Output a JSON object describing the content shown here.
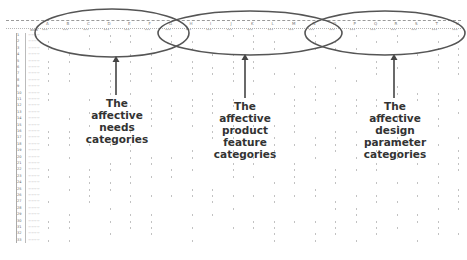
{
  "figure": {
    "spreadsheet": {
      "column_letters": [
        "A",
        "B",
        "C",
        "D",
        "E",
        "F",
        "G",
        "H",
        "I",
        "J",
        "K",
        "L",
        "M",
        "N",
        "O",
        "P",
        "Q",
        "R",
        "S",
        "T",
        "U"
      ],
      "row_count": 33,
      "first_column_header": "word"
    },
    "annotations": [
      {
        "id": "needs",
        "label_lines": [
          "The",
          "affective",
          "needs",
          "categories"
        ]
      },
      {
        "id": "product_feature",
        "label_lines": [
          "The",
          "affective",
          "product",
          "feature",
          "categories"
        ]
      },
      {
        "id": "design_parameter",
        "label_lines": [
          "The",
          "affective",
          "design",
          "parameter",
          "categories"
        ]
      }
    ],
    "colors": {
      "ellipse_stroke": "#555555",
      "label_text": "#333333",
      "grid": "#b5b5b5"
    }
  }
}
